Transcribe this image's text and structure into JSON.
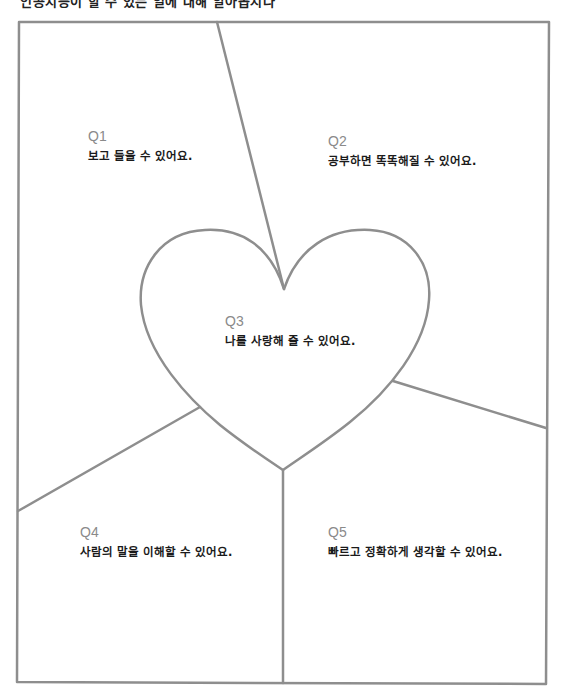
{
  "top_text": "인공지능이 할 수 있는 일에 대해 알아봅시다",
  "colors": {
    "line": "#8e8e8e",
    "question": "#8a8a8a",
    "text": "#1a1a1a"
  },
  "sections": [
    {
      "id": "Q1",
      "text": "보고 들을 수 있어요."
    },
    {
      "id": "Q2",
      "text": "공부하면 똑똑해질 수 있어요."
    },
    {
      "id": "Q3",
      "text": "나를 사랑해 줄 수 있어요."
    },
    {
      "id": "Q4",
      "text": "사람의 말을 이해할 수 있어요."
    },
    {
      "id": "Q5",
      "text": "빠르고 정확하게 생각할 수 있어요."
    }
  ]
}
